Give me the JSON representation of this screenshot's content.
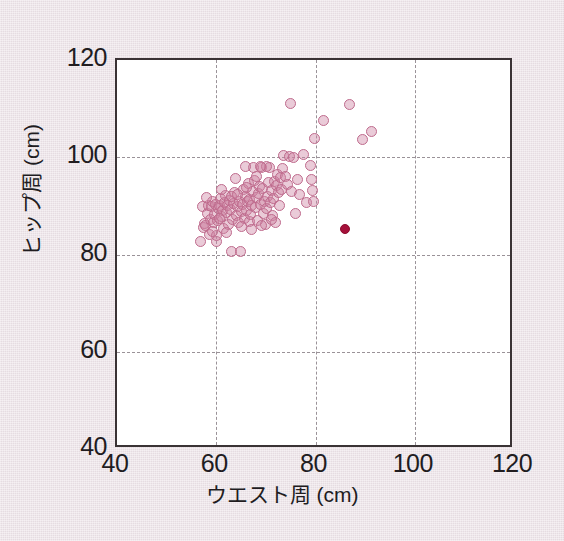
{
  "figure": {
    "background_color": "#ece2e7",
    "plot_background_color": "#ffffff",
    "frame_color": "#3a3335",
    "grid_color": "#9a9298",
    "point_color": "#bf6b8d",
    "point_fill": "rgba(206,130,162,0.42)",
    "highlight_color": "#a5103a",
    "caption": ""
  },
  "chart_data": {
    "type": "scatter",
    "title": "",
    "xlabel": "ウエスト周 (cm)",
    "ylabel": "ヒップ周 (cm)",
    "xlim": [
      40,
      120
    ],
    "ylim": [
      40,
      120
    ],
    "xticks": [
      40,
      60,
      80,
      100,
      120
    ],
    "yticks": [
      40,
      60,
      80,
      100,
      120
    ],
    "xticklabels": [
      "40",
      "60",
      "80",
      "100",
      "120"
    ],
    "yticklabels": [
      "40",
      "60",
      "80",
      "100",
      "120"
    ],
    "grid": true,
    "grid_style": "dashed",
    "gridlines_x": [
      60,
      80,
      100
    ],
    "gridlines_y": [
      60,
      80,
      100
    ],
    "legend": null,
    "series": [
      {
        "name": "サンプル",
        "marker": "open-circle",
        "color": "#bf6b8d",
        "points": [
          [
            56.8,
            82.6
          ],
          [
            57.2,
            89.8
          ],
          [
            57.4,
            85.5
          ],
          [
            57.6,
            86.3
          ],
          [
            57.9,
            86.0
          ],
          [
            58.2,
            88.4
          ],
          [
            58.4,
            90.0
          ],
          [
            58.6,
            84.2
          ],
          [
            58.8,
            87.2
          ],
          [
            59.0,
            89.9
          ],
          [
            59.2,
            91.0
          ],
          [
            59.4,
            86.6
          ],
          [
            59.6,
            88.2
          ],
          [
            59.8,
            90.3
          ],
          [
            60.0,
            82.7
          ],
          [
            60.1,
            84.0
          ],
          [
            60.3,
            86.9
          ],
          [
            60.5,
            89.4
          ],
          [
            60.6,
            90.1
          ],
          [
            60.8,
            91.6
          ],
          [
            61.0,
            87.8
          ],
          [
            61.2,
            89.0
          ],
          [
            61.4,
            85.4
          ],
          [
            61.6,
            90.6
          ],
          [
            61.8,
            92.2
          ],
          [
            62.0,
            88.6
          ],
          [
            62.2,
            90.0
          ],
          [
            62.4,
            86.2
          ],
          [
            62.6,
            91.2
          ],
          [
            62.8,
            89.3
          ],
          [
            63.0,
            80.6
          ],
          [
            63.2,
            87.1
          ],
          [
            63.4,
            90.4
          ],
          [
            63.6,
            92.8
          ],
          [
            63.8,
            95.6
          ],
          [
            64.0,
            88.0
          ],
          [
            64.2,
            89.8
          ],
          [
            64.4,
            86.5
          ],
          [
            64.6,
            91.0
          ],
          [
            64.8,
            80.6
          ],
          [
            65.0,
            88.8
          ],
          [
            65.2,
            90.2
          ],
          [
            65.4,
            93.3
          ],
          [
            65.6,
            87.4
          ],
          [
            65.8,
            92.0
          ],
          [
            66.0,
            89.1
          ],
          [
            66.2,
            90.9
          ],
          [
            66.4,
            94.6
          ],
          [
            66.6,
            86.8
          ],
          [
            66.8,
            91.4
          ],
          [
            67.0,
            88.3
          ],
          [
            67.2,
            90.0
          ],
          [
            67.4,
            93.0
          ],
          [
            67.6,
            97.8
          ],
          [
            67.8,
            95.2
          ],
          [
            68.0,
            89.6
          ],
          [
            68.2,
            91.8
          ],
          [
            68.4,
            87.0
          ],
          [
            68.6,
            92.5
          ],
          [
            68.8,
            94.0
          ],
          [
            69.0,
            90.2
          ],
          [
            69.2,
            97.9
          ],
          [
            69.4,
            93.6
          ],
          [
            69.6,
            88.5
          ],
          [
            69.8,
            91.0
          ],
          [
            70.0,
            86.2
          ],
          [
            70.2,
            89.4
          ],
          [
            70.4,
            92.0
          ],
          [
            70.6,
            94.8
          ],
          [
            70.8,
            97.8
          ],
          [
            71.0,
            90.6
          ],
          [
            71.2,
            93.2
          ],
          [
            71.4,
            88.0
          ],
          [
            71.6,
            91.5
          ],
          [
            71.8,
            95.0
          ],
          [
            72.0,
            86.6
          ],
          [
            72.2,
            94.2
          ],
          [
            72.4,
            96.4
          ],
          [
            72.6,
            92.8
          ],
          [
            72.8,
            90.0
          ],
          [
            73.0,
            95.8
          ],
          [
            73.2,
            93.4
          ],
          [
            73.4,
            97.6
          ],
          [
            73.6,
            100.4
          ],
          [
            74.0,
            96.0
          ],
          [
            74.4,
            94.4
          ],
          [
            74.8,
            100.2
          ],
          [
            75.0,
            111.0
          ],
          [
            75.2,
            93.0
          ],
          [
            75.6,
            100.0
          ],
          [
            76.0,
            88.5
          ],
          [
            76.4,
            95.5
          ],
          [
            76.8,
            92.4
          ],
          [
            77.6,
            100.5
          ],
          [
            78.2,
            90.6
          ],
          [
            79.0,
            98.4
          ],
          [
            79.2,
            95.4
          ],
          [
            79.4,
            93.2
          ],
          [
            79.6,
            91.0
          ],
          [
            79.8,
            103.8
          ],
          [
            81.6,
            107.6
          ],
          [
            86.8,
            110.9
          ],
          [
            89.4,
            103.6
          ],
          [
            91.2,
            105.2
          ],
          [
            59.3,
            84.8
          ],
          [
            60.7,
            87.5
          ],
          [
            62.1,
            84.6
          ],
          [
            63.1,
            92.0
          ],
          [
            64.3,
            92.4
          ],
          [
            65.1,
            85.8
          ],
          [
            66.1,
            93.8
          ],
          [
            67.1,
            85.2
          ],
          [
            68.1,
            96.0
          ],
          [
            69.1,
            86.0
          ],
          [
            70.1,
            98.0
          ],
          [
            71.1,
            87.2
          ],
          [
            58.1,
            91.8
          ],
          [
            61.1,
            93.4
          ],
          [
            65.9,
            98.0
          ],
          [
            68.9,
            98.2
          ]
        ]
      },
      {
        "name": "対象者",
        "marker": "filled-circle",
        "color": "#a5103a",
        "points": [
          [
            86.0,
            85.2
          ]
        ]
      }
    ]
  },
  "axes": {
    "x_title": "ウエスト周 (cm)",
    "y_title": "ヒップ周 (cm)"
  }
}
